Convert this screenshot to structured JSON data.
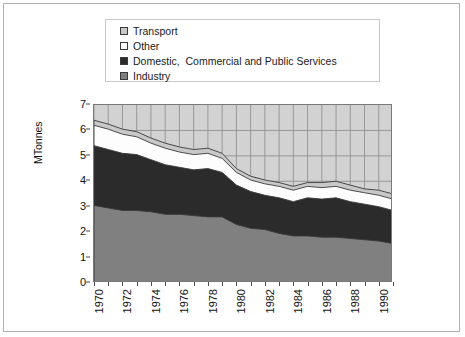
{
  "legend": {
    "position": "top",
    "items": [
      {
        "label": "Transport",
        "color": "#c8c8c8",
        "name": "legend-item-transport"
      },
      {
        "label": "Other",
        "color": "#fdfdfd",
        "name": "legend-item-other"
      },
      {
        "label": "Domestic,  Commercial and Public Services",
        "color": "#2b2b2b",
        "name": "legend-item-domestic"
      },
      {
        "label": "Industry",
        "color": "#808080",
        "name": "legend-item-industry"
      }
    ]
  },
  "axes": {
    "ylabel": "MTonnes",
    "yticks": [
      "0",
      "1",
      "2",
      "3",
      "4",
      "5",
      "6",
      "7"
    ],
    "ylim": [
      0,
      7
    ],
    "xticks": [
      "1970",
      "1972",
      "1974",
      "1976",
      "1978",
      "1980",
      "1982",
      "1984",
      "1986",
      "1988",
      "1990"
    ]
  },
  "chart_data": {
    "type": "area",
    "title": "",
    "xlabel": "",
    "ylabel": "MTonnes",
    "ylim": [
      0,
      7
    ],
    "grid": true,
    "stacked": true,
    "legend_position": "top",
    "x": [
      1970,
      1971,
      1972,
      1973,
      1974,
      1975,
      1976,
      1977,
      1978,
      1979,
      1980,
      1981,
      1982,
      1983,
      1984,
      1985,
      1986,
      1987,
      1988,
      1989,
      1990,
      1991
    ],
    "categories": [
      "1970",
      "1971",
      "1972",
      "1973",
      "1974",
      "1975",
      "1976",
      "1977",
      "1978",
      "1979",
      "1980",
      "1981",
      "1982",
      "1983",
      "1984",
      "1985",
      "1986",
      "1987",
      "1988",
      "1989",
      "1990",
      "1991"
    ],
    "series": [
      {
        "name": "Industry",
        "color": "#808080",
        "values": [
          3.05,
          2.95,
          2.85,
          2.85,
          2.8,
          2.7,
          2.7,
          2.65,
          2.6,
          2.6,
          2.3,
          2.15,
          2.1,
          1.95,
          1.85,
          1.85,
          1.8,
          1.8,
          1.75,
          1.7,
          1.65,
          1.55
        ]
      },
      {
        "name": "Domestic,  Commercial and Public Services",
        "color": "#2b2b2b",
        "values": [
          2.35,
          2.3,
          2.25,
          2.2,
          2.05,
          1.95,
          1.85,
          1.8,
          1.9,
          1.75,
          1.55,
          1.45,
          1.35,
          1.4,
          1.35,
          1.5,
          1.5,
          1.55,
          1.45,
          1.4,
          1.35,
          1.3
        ]
      },
      {
        "name": "Other",
        "color": "#fdfdfd",
        "values": [
          0.8,
          0.8,
          0.75,
          0.7,
          0.65,
          0.65,
          0.6,
          0.6,
          0.6,
          0.55,
          0.5,
          0.45,
          0.45,
          0.45,
          0.45,
          0.45,
          0.45,
          0.45,
          0.45,
          0.45,
          0.45,
          0.45
        ]
      },
      {
        "name": "Transport",
        "color": "#c8c8c8",
        "values": [
          0.2,
          0.2,
          0.2,
          0.2,
          0.2,
          0.2,
          0.2,
          0.2,
          0.2,
          0.2,
          0.15,
          0.15,
          0.15,
          0.15,
          0.15,
          0.15,
          0.2,
          0.2,
          0.2,
          0.15,
          0.2,
          0.2
        ]
      }
    ],
    "totals": [
      6.4,
      6.25,
      6.05,
      5.95,
      5.7,
      5.5,
      5.35,
      5.25,
      5.3,
      5.1,
      4.5,
      4.2,
      4.05,
      3.95,
      3.8,
      3.95,
      3.95,
      4.0,
      3.85,
      3.7,
      3.65,
      3.5
    ]
  }
}
